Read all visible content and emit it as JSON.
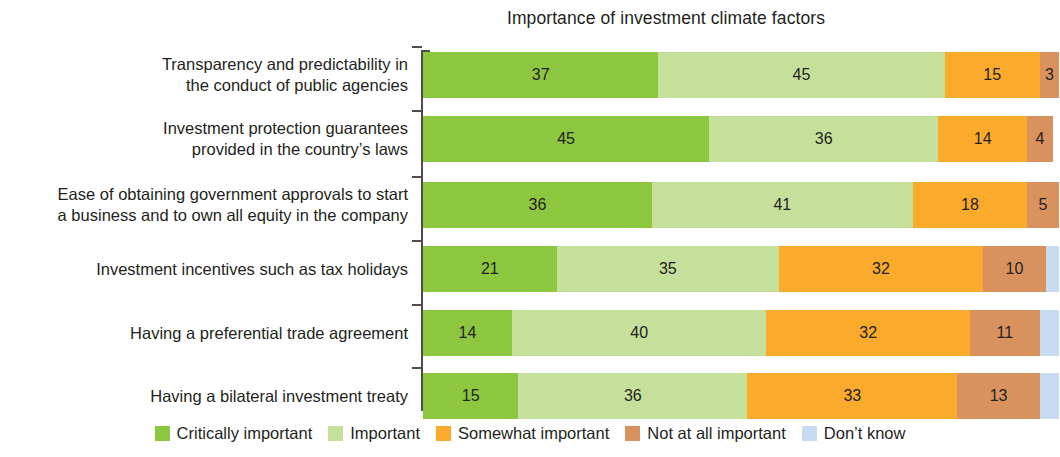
{
  "chart_data": {
    "type": "bar",
    "subtype": "stacked-horizontal-100pct",
    "title": "Importance of investment climate factors",
    "xlabel": "",
    "ylabel": "",
    "xlim": [
      0,
      100
    ],
    "grid": false,
    "legend_position": "bottom-center",
    "categories": [
      "Transparency and predictability in\nthe conduct of public agencies",
      "Investment protection guarantees\nprovided in the country’s laws",
      "Ease of obtaining government approvals to start\na business and to own all equity in the company",
      "Investment incentives such as tax holidays",
      "Having a preferential trade agreement",
      "Having a bilateral investment treaty"
    ],
    "series": [
      {
        "name": "Critically important",
        "color": "#8dc63f",
        "values": [
          37,
          45,
          36,
          21,
          14,
          15
        ],
        "labels": [
          "37",
          "45",
          "36",
          "21",
          "14",
          "15"
        ]
      },
      {
        "name": "Important",
        "color": "#c5e09a",
        "values": [
          45,
          36,
          41,
          35,
          40,
          36
        ],
        "labels": [
          "45",
          "36",
          "41",
          "35",
          "40",
          "36"
        ]
      },
      {
        "name": "Somewhat important",
        "color": "#fbab2c",
        "values": [
          15,
          14,
          18,
          32,
          32,
          33
        ],
        "labels": [
          "15",
          "14",
          "18",
          "32",
          "32",
          "33"
        ]
      },
      {
        "name": "Not at all important",
        "color": "#d9925e",
        "values": [
          3,
          4,
          5,
          10,
          11,
          13
        ],
        "labels": [
          "3",
          "4",
          "5",
          "10",
          "11",
          "13"
        ]
      },
      {
        "name": "Don’t know",
        "color": "#c7dcf2",
        "values": [
          0,
          0,
          0,
          2,
          3,
          3
        ],
        "labels": [
          "",
          "",
          "",
          "",
          "",
          ""
        ]
      }
    ]
  },
  "legend": {
    "items": [
      {
        "label": "Critically important",
        "color": "#8dc63f"
      },
      {
        "label": "Important",
        "color": "#c5e09a"
      },
      {
        "label": "Somewhat important",
        "color": "#fbab2c"
      },
      {
        "label": "Not at all important",
        "color": "#d9925e"
      },
      {
        "label": "Don’t know",
        "color": "#c7dcf2"
      }
    ]
  }
}
